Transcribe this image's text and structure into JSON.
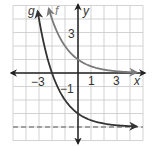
{
  "chart_data": {
    "type": "line",
    "title": "",
    "xlabel": "x",
    "ylabel": "y",
    "xlim": [
      -5,
      5
    ],
    "ylim": [
      -5,
      5
    ],
    "grid": true,
    "x_tick_labels": [
      {
        "value": -3,
        "label": "−3"
      },
      {
        "value": 1,
        "label": "1"
      },
      {
        "value": 3,
        "label": "3"
      }
    ],
    "y_tick_labels": [
      {
        "value": 3,
        "label": "3"
      },
      {
        "value": -1,
        "label": "−1"
      }
    ],
    "series": [
      {
        "name": "f",
        "label": "f",
        "color": "#7a7a7a",
        "formula": "(1/2)^x",
        "x": [
          -2.25,
          -2,
          -1,
          0,
          1,
          2,
          3,
          4.5
        ],
        "y": [
          4.76,
          4,
          2,
          1,
          0.5,
          0.25,
          0.125,
          0.04
        ]
      },
      {
        "name": "g",
        "label": "g",
        "color": "#333333",
        "formula": "(1/2)^x - 4",
        "x": [
          -3.1,
          -3,
          -2,
          -1,
          0,
          1,
          2,
          3,
          4.5
        ],
        "y": [
          4.57,
          4,
          0,
          -2,
          -3,
          -3.5,
          -3.75,
          -3.875,
          -3.96
        ]
      }
    ],
    "asymptotes": [
      {
        "type": "horizontal",
        "y": -4,
        "style": "dashed",
        "color": "#888888"
      }
    ]
  },
  "labels": {
    "x_axis": "x",
    "y_axis": "y",
    "f_label": "f",
    "g_label": "g",
    "x_tick_neg3": "−3",
    "x_tick_1": "1",
    "x_tick_3": "3",
    "y_tick_3": "3",
    "y_tick_neg1": "−1"
  }
}
